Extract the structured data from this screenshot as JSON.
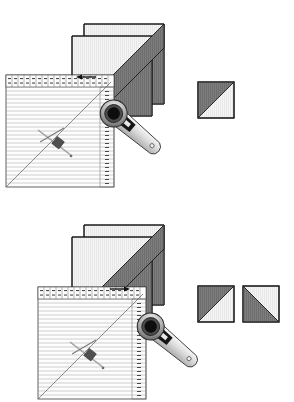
{
  "document": {
    "title": "Half-Square Triangle Cutting Diagram",
    "type": "quilting-instruction-illustration",
    "panel_count": 2,
    "background_color": "#ffffff"
  },
  "colors": {
    "fabric_dark": "#7d7d7d",
    "fabric_dark_stripe": "#6e6e6e",
    "fabric_light": "#f2f2f2",
    "fabric_light_stripe": "#e6e6e6",
    "outline": "#1a1a1a",
    "ruler_line": "#8c8c8c",
    "ruler_fill": "#fdfdfd",
    "cutter_body": "#d0d0d0",
    "cutter_grip": "#1a1a1a",
    "cutter_hub": "#111111",
    "pin_metal": "#9a9a9a",
    "arrow": "#111111"
  },
  "panels": [
    {
      "id": "panel-top",
      "label": "Step 1 — single cut",
      "fabric_stack": {
        "name": "layered-fabric-squares",
        "description": "Two squares layered right sides together with a dark diagonal band",
        "x": 72,
        "y": 24,
        "width": 92,
        "height": 92,
        "offset_x": 12,
        "offset_y": 12,
        "diagonal": "bottom-left-to-top-right"
      },
      "ruler": {
        "name": "quilting-ruler",
        "x": 6,
        "y": 75,
        "width": 108,
        "height": 112,
        "grid_lines": 26,
        "has_diagonal_45": true,
        "top_label_row_count": 16,
        "right_label_row_count": 24
      },
      "rotary_cutter": {
        "name": "rotary-cutter",
        "blade_center_x": 115,
        "blade_center_y": 112,
        "blade_radius": 13,
        "handle_angle_deg": 52,
        "handle_length": 58
      },
      "pin": {
        "name": "straight-pin",
        "x": 38,
        "y": 132,
        "angle_deg": 42
      },
      "arrow": {
        "name": "cut-direction-arrow",
        "x": 78,
        "y": 76,
        "length": 18,
        "direction": "left"
      },
      "results": [
        {
          "name": "half-square-triangle-unit",
          "x": 198,
          "y": 82,
          "size": 36,
          "dark_corner": "top-left",
          "light_corner": "bottom-right"
        }
      ]
    },
    {
      "id": "panel-bottom",
      "label": "Step 2 — two units produced",
      "fabric_stack": {
        "name": "layered-fabric-squares",
        "description": "Two squares layered right sides together with a dark diagonal band",
        "x": 72,
        "y": 24,
        "width": 92,
        "height": 92,
        "offset_x": 12,
        "offset_y": 12,
        "diagonal": "bottom-left-to-top-right"
      },
      "ruler": {
        "name": "quilting-ruler",
        "x": 38,
        "y": 86,
        "width": 108,
        "height": 112,
        "grid_lines": 26,
        "has_diagonal_45": true,
        "top_label_row_count": 16,
        "right_label_row_count": 24
      },
      "rotary_cutter": {
        "name": "rotary-cutter",
        "blade_center_x": 152,
        "blade_center_y": 124,
        "blade_radius": 13,
        "handle_angle_deg": 52,
        "handle_length": 58
      },
      "pin": {
        "name": "straight-pin",
        "x": 70,
        "y": 143,
        "angle_deg": 42
      },
      "arrow": {
        "name": "cut-direction-arrow",
        "x": 110,
        "y": 87,
        "length": 18,
        "direction": "right"
      },
      "results": [
        {
          "name": "half-square-triangle-unit",
          "x": 198,
          "y": 85,
          "size": 36,
          "dark_corner": "bottom-left",
          "light_corner": "top-right"
        },
        {
          "name": "half-square-triangle-unit",
          "x": 243,
          "y": 85,
          "size": 36,
          "dark_corner": "bottom-left",
          "light_corner": "top-right"
        }
      ]
    }
  ]
}
